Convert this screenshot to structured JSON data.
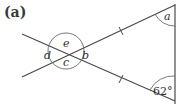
{
  "figure": {
    "label": "(a)",
    "angles": {
      "a": "a",
      "b": "b",
      "c": "c",
      "d": "d",
      "e": "e",
      "given": "62°"
    },
    "colors": {
      "line": "#4a4a4a",
      "text": "#333333",
      "background": "#ffffff"
    }
  }
}
